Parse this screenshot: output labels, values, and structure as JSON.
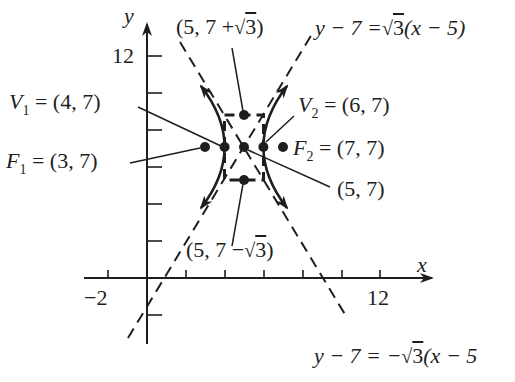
{
  "figure": {
    "type": "hyperbola-diagram",
    "axes": {
      "x_label": "x",
      "y_label": "y",
      "x_tick_labels": [
        {
          "value": -2,
          "label": "−2"
        },
        {
          "value": 12,
          "label": "12"
        }
      ],
      "y_tick_labels": [
        {
          "value": 12,
          "label": "12"
        }
      ],
      "x_ticks": [
        -2,
        0,
        2,
        4,
        6,
        8,
        10,
        12
      ],
      "y_ticks": [
        -2,
        2,
        4,
        6,
        8,
        10,
        12
      ]
    },
    "hyperbola": {
      "equation": "(x-5)^2 - (y-7)^2/3 = 1",
      "center": [
        5,
        7
      ],
      "a": 1,
      "b_sqrt": "sqrt(3)"
    },
    "labels": {
      "center": "(5, 7)",
      "top_point": {
        "prefix": "(5, 7 +",
        "radical": "3",
        "suffix": ")"
      },
      "bottom_point": {
        "prefix": "(5, 7 −",
        "radical": "3",
        "suffix": ")"
      },
      "v1": {
        "name": "V",
        "sub": "1",
        "value": "= (4, 7)"
      },
      "v2": {
        "name": "V",
        "sub": "2",
        "value": "= (6, 7)"
      },
      "f1": {
        "name": "F",
        "sub": "1",
        "value": "= (3, 7)"
      },
      "f2": {
        "name": "F",
        "sub": "2",
        "value": "= (7, 7)"
      },
      "asymptote_pos": {
        "lhs": "y − 7 =",
        "radical": "3",
        "rhs": "(x − 5)"
      },
      "asymptote_neg": {
        "lhs": "y − 7 = −",
        "radical": "3",
        "rhs": "(x − 5"
      }
    },
    "points": [
      {
        "name": "F1",
        "x": 3,
        "y": 7
      },
      {
        "name": "V1",
        "x": 4,
        "y": 7
      },
      {
        "name": "center",
        "x": 5,
        "y": 7
      },
      {
        "name": "V2",
        "x": 6,
        "y": 7
      },
      {
        "name": "F2",
        "x": 7,
        "y": 7
      },
      {
        "name": "top",
        "x": 5,
        "y": "7+sqrt(3)"
      },
      {
        "name": "bottom",
        "x": 5,
        "y": "7-sqrt(3)"
      }
    ],
    "colors": {
      "ink": "#1e1e1e",
      "background": "#ffffff"
    }
  }
}
